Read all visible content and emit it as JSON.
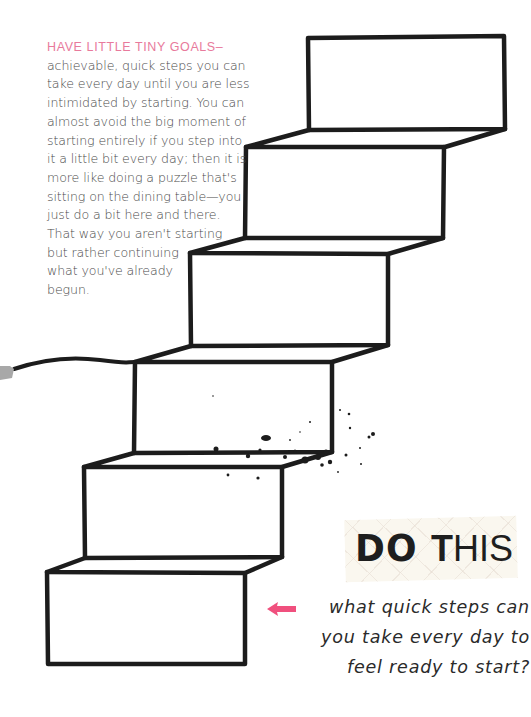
{
  "intro": {
    "heading": "HAVE LITTLE TINY GOALS–",
    "lines": [
      "achievable, quick steps you can",
      "take every day until you are less",
      "intimidated by starting. You can",
      "almost avoid the big moment of",
      "starting entirely if you step into",
      "it a little bit every day; then it is",
      "more like doing a puzzle that's",
      "sitting on the dining table—you",
      "just do a bit here and there.",
      "That way you aren't starting",
      "but rather continuing",
      "what you've already",
      "begun."
    ]
  },
  "callout": {
    "title_word1": "DO",
    "title_word2_first": "T",
    "title_word2_rest": "HIS",
    "arrow_icon": "left-arrow-icon",
    "arrow_color": "#f0507e",
    "prompt_lines": [
      "what quick steps can",
      "you take every day to",
      "feel ready to start?"
    ]
  },
  "illustration": {
    "name": "staircase-drawing",
    "steps": 6,
    "ink_color": "#1c1c1c",
    "tab_color": "#a8a8a8"
  }
}
